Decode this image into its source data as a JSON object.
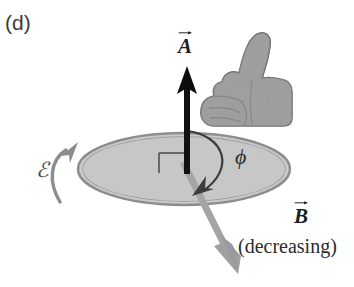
{
  "figure": {
    "panel_label": "(d)",
    "kind": "physics-diagram"
  },
  "labels": {
    "area_vector": "A",
    "field_vector": "B",
    "angle": "ϕ",
    "emf": "ℰ",
    "field_state": "(decreasing)"
  },
  "colors": {
    "area_vector": "#111111",
    "field_vector": "#9a9a9a",
    "loop_fill": "#c9c9c9",
    "loop_rim": "#8f8f8f",
    "hand_fill": "#9c9c9c",
    "hand_outline": "#6b6b6b",
    "emf_arrow": "#8c8c8c",
    "angle_arc": "#3a3a3a",
    "text": "#2b2b2b",
    "background": "#ffffff"
  },
  "geometry": {
    "loop_center_x": 184,
    "loop_center_y": 169,
    "loop_radius_x": 106,
    "loop_radius_y": 36,
    "area_vector_tip_y": 68,
    "area_vector_base_y": 172,
    "field_vector_tip_x": 238,
    "field_vector_tip_y": 272
  },
  "icons": {
    "hand": "thumbs-up-right-hand-icon",
    "area_arrow": "area-vector-arrow-icon",
    "field_arrow": "field-vector-arrow-icon",
    "emf_arrow": "emf-curved-arrow-icon",
    "angle_arc": "angle-arc-arrow-icon",
    "right_angle": "right-angle-mark-icon"
  }
}
